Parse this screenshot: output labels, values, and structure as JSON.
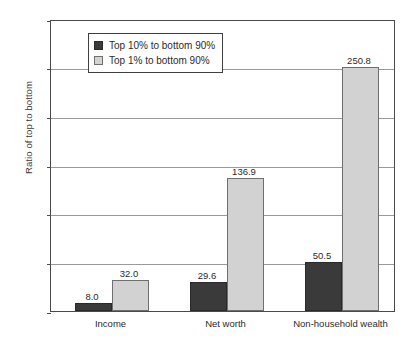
{
  "chart_data": {
    "type": "bar",
    "title": "",
    "xlabel": "",
    "ylabel": "Ratio of top to bottom",
    "ylim": [
      0,
      300
    ],
    "yticks": [
      0,
      50,
      100,
      150,
      200,
      250,
      300
    ],
    "ytick_labels": [
      "0",
      "50",
      "100",
      "150",
      "200",
      "250",
      "300"
    ],
    "grid": true,
    "legend_position": "upper left",
    "categories": [
      "Income",
      "Net worth",
      "Non-household wealth"
    ],
    "series": [
      {
        "name": "Top 10% to bottom 90%",
        "color": "#3a3a3a",
        "values": [
          8.0,
          29.6,
          50.5
        ],
        "labels": [
          "8.0",
          "29.6",
          "50.5"
        ]
      },
      {
        "name": "Top 1% to bottom 90%",
        "color": "#d2d2d2",
        "values": [
          32.0,
          136.9,
          250.8
        ],
        "labels": [
          "32.0",
          "136.9",
          "250.8"
        ]
      }
    ]
  },
  "legend": {
    "entries": [
      {
        "label": "Top 10% to bottom 90%"
      },
      {
        "label": "Top 1% to bottom 90%"
      }
    ]
  },
  "axes": {
    "y_title": "Ratio of top to bottom"
  }
}
